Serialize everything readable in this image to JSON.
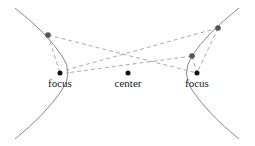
{
  "diagram": {
    "labels": {
      "left_focus": "focus",
      "center": "center",
      "right_focus": "focus"
    },
    "colors": {
      "curve": "#888888",
      "dashed": "#aaaaaa",
      "point_on_curve": "#555555",
      "focus_point": "#111111",
      "text": "#222222"
    }
  }
}
